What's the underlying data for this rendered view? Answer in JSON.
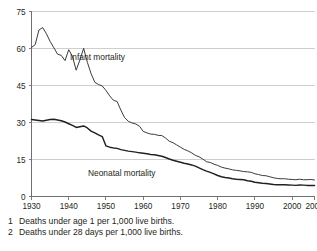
{
  "chart_data": {
    "type": "line",
    "title": "",
    "xlabel": "",
    "ylabel": "",
    "xlim": [
      1930,
      2006
    ],
    "ylim": [
      0,
      75
    ],
    "grid": true,
    "legend": "inline-annotations",
    "x_ticks": [
      "1930",
      "1940",
      "1950",
      "1960",
      "1970",
      "1980",
      "1990",
      "2000",
      "2006"
    ],
    "x_tick_values": [
      1930,
      1940,
      1950,
      1960,
      1970,
      1980,
      1990,
      2000,
      2006
    ],
    "y_ticks": [
      "0",
      "15",
      "30",
      "45",
      "60",
      "75"
    ],
    "y_tick_values": [
      0,
      15,
      30,
      45,
      60,
      75
    ],
    "x": [
      1930,
      1931,
      1932,
      1933,
      1934,
      1935,
      1936,
      1937,
      1938,
      1939,
      1940,
      1941,
      1942,
      1943,
      1944,
      1945,
      1946,
      1947,
      1948,
      1949,
      1950,
      1951,
      1952,
      1953,
      1954,
      1955,
      1956,
      1957,
      1958,
      1959,
      1960,
      1961,
      1962,
      1963,
      1964,
      1965,
      1966,
      1967,
      1968,
      1969,
      1970,
      1971,
      1972,
      1973,
      1974,
      1975,
      1976,
      1977,
      1978,
      1979,
      1980,
      1981,
      1982,
      1983,
      1984,
      1985,
      1986,
      1987,
      1988,
      1989,
      1990,
      1991,
      1992,
      1993,
      1994,
      1995,
      1996,
      1997,
      1998,
      1999,
      2000,
      2001,
      2002,
      2003,
      2004,
      2005,
      2006
    ],
    "series": [
      {
        "name": "Infant mortality",
        "label": "Infant mortality",
        "color": "#3b3b3b",
        "footnote": 1,
        "values": [
          60.4,
          61.6,
          67.5,
          68.5,
          66.0,
          62.9,
          60.3,
          57.7,
          57.2,
          55.1,
          59.5,
          56.8,
          51.2,
          55.4,
          60.1,
          54.4,
          49.8,
          46.3,
          45.4,
          44.8,
          43.0,
          40.8,
          39.0,
          38.5,
          35.0,
          32.0,
          30.5,
          29.8,
          29.4,
          28.5,
          26.4,
          25.8,
          25.3,
          25.2,
          24.8,
          24.7,
          23.7,
          22.4,
          21.8,
          20.9,
          20.0,
          19.1,
          18.5,
          17.7,
          16.7,
          16.1,
          15.2,
          14.1,
          13.8,
          13.1,
          12.6,
          11.9,
          11.5,
          11.2,
          10.8,
          10.6,
          10.4,
          10.1,
          10.0,
          9.8,
          9.2,
          8.9,
          8.5,
          8.4,
          8.0,
          7.6,
          7.3,
          7.2,
          7.2,
          7.0,
          6.9,
          6.8,
          7.0,
          6.8,
          6.8,
          6.9,
          6.7
        ]
      },
      {
        "name": "Neonatal mortality",
        "label": "Neonatal mortality",
        "color": "#231f20",
        "footnote": 2,
        "values": [
          31.2,
          31.0,
          30.8,
          30.6,
          30.9,
          31.2,
          31.3,
          31.0,
          30.7,
          30.2,
          29.5,
          28.8,
          28.0,
          28.3,
          28.6,
          27.8,
          26.5,
          25.8,
          25.0,
          24.3,
          20.5,
          20.0,
          19.7,
          19.5,
          19.0,
          18.7,
          18.4,
          18.2,
          18.0,
          17.7,
          17.5,
          17.3,
          17.0,
          16.9,
          16.6,
          16.3,
          15.8,
          15.2,
          14.7,
          14.3,
          13.9,
          13.5,
          13.2,
          12.8,
          12.3,
          11.6,
          10.9,
          10.3,
          9.8,
          9.2,
          8.5,
          8.0,
          7.7,
          7.5,
          7.2,
          7.0,
          6.9,
          6.8,
          6.4,
          6.2,
          5.8,
          5.6,
          5.4,
          5.3,
          5.1,
          4.9,
          4.8,
          4.8,
          4.8,
          4.7,
          4.6,
          4.5,
          4.7,
          4.6,
          4.5,
          4.5,
          4.5
        ]
      }
    ]
  },
  "axis": {
    "y_axis_name": "mortality-rate-axis",
    "x_axis_name": "year-axis"
  },
  "annotations": {
    "infant": "Infant mortality",
    "neonatal": "Neonatal mortality"
  },
  "footnotes": [
    {
      "marker": "1",
      "text": "Deaths under age 1 per 1,000 live births."
    },
    {
      "marker": "2",
      "text": "Deaths under 28 days per 1,000 live births."
    }
  ],
  "colors": {
    "gridline": "#c9c9c9",
    "axis": "#6f6f6f",
    "infant_line": "#3b3b3b",
    "neonatal_line": "#231f20",
    "text": "#231f20",
    "background": "#ffffff"
  }
}
